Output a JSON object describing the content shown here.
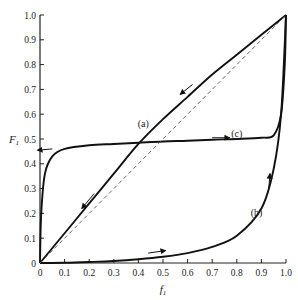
{
  "chart_data": {
    "type": "line",
    "title": "",
    "xlabel": "f1",
    "ylabel": "F1",
    "xlim": [
      0,
      1
    ],
    "ylim": [
      0,
      1
    ],
    "grid": false,
    "x_ticks": [
      "0",
      "0.1",
      "0.2",
      "0.3",
      "0.4",
      "0.5",
      "0.6",
      "0.7",
      "0.8",
      "0.9",
      "1.0"
    ],
    "y_ticks": [
      "0",
      "0.1",
      "0.2",
      "0.3",
      "0.4",
      "0.5",
      "0.6",
      "0.7",
      "0.8",
      "0.9",
      "1.0"
    ],
    "series": [
      {
        "name": "(a)",
        "label_pos": [
          0.42,
          0.55
        ],
        "x": [
          0,
          0.1,
          0.2,
          0.3,
          0.4,
          0.5,
          0.6,
          0.7,
          0.8,
          0.9,
          1.0
        ],
        "y": [
          0,
          0.12,
          0.24,
          0.36,
          0.48,
          0.58,
          0.67,
          0.76,
          0.84,
          0.92,
          1.0
        ]
      },
      {
        "name": "(b)",
        "label_pos": [
          0.88,
          0.19
        ],
        "x": [
          0,
          0.1,
          0.2,
          0.3,
          0.4,
          0.5,
          0.6,
          0.7,
          0.8,
          0.9,
          0.95,
          0.98,
          1.0
        ],
        "y": [
          0,
          0.001,
          0.004,
          0.008,
          0.015,
          0.025,
          0.04,
          0.065,
          0.11,
          0.22,
          0.38,
          0.6,
          1.0
        ]
      },
      {
        "name": "(c)",
        "label_pos": [
          0.8,
          0.51
        ],
        "x": [
          0,
          0.005,
          0.02,
          0.05,
          0.1,
          0.2,
          0.3,
          0.4,
          0.5,
          0.6,
          0.7,
          0.8,
          0.9,
          0.95,
          0.98,
          0.995,
          1.0
        ],
        "y": [
          0,
          0.2,
          0.36,
          0.43,
          0.46,
          0.475,
          0.48,
          0.485,
          0.49,
          0.493,
          0.497,
          0.5,
          0.505,
          0.515,
          0.6,
          0.8,
          1.0
        ]
      },
      {
        "name": "diagonal (dashed)",
        "x": [
          0,
          1
        ],
        "y": [
          0,
          1
        ]
      }
    ],
    "annotations": [
      "(a)",
      "(b)",
      "(c)",
      "direction arrows along curves"
    ]
  }
}
